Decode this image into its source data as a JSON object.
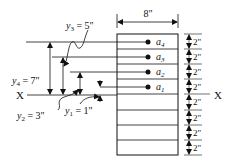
{
  "diagram": {
    "width_label": "8\"",
    "axis_label_left": "X",
    "axis_label_right": "X",
    "layer_spacing_labels": [
      "2\"",
      "2\"",
      "2\"",
      "2\"",
      "2\"",
      "2\"",
      "2\"",
      "2\""
    ],
    "layers": [
      {
        "name": "a",
        "sub": "4"
      },
      {
        "name": "a",
        "sub": "3"
      },
      {
        "name": "a",
        "sub": "2"
      },
      {
        "name": "a",
        "sub": "1"
      }
    ],
    "distances": [
      {
        "var": "y",
        "sub": "4",
        "value": "7\""
      },
      {
        "var": "y",
        "sub": "3",
        "value": "5\""
      },
      {
        "var": "y",
        "sub": "2",
        "value": "3\""
      },
      {
        "var": "y",
        "sub": "1",
        "value": "1\""
      }
    ],
    "eq": "="
  }
}
